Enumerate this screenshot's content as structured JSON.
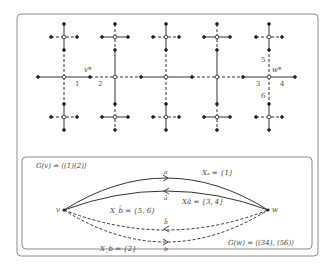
{
  "top_panel": {
    "vertex_labels": {
      "v_star": "v*",
      "w_star": "w*"
    },
    "edge_labels": [
      "1",
      "2",
      "3",
      "4",
      "5",
      "6"
    ]
  },
  "bottom_panel": {
    "G_v": "G(v) = ⟨(1)(2)⟩",
    "G_w": "G(w) = ⟨(34), (56)⟩",
    "vertex_v": "v",
    "vertex_w": "w",
    "edges": [
      {
        "id": "a",
        "label": "a",
        "set_label": "Xₐ = {1}",
        "style": "solid"
      },
      {
        "id": "abar",
        "label": "ā",
        "set_label": "Xā = {3, 4}",
        "style": "solid"
      },
      {
        "id": "bbar",
        "label": "b̄",
        "set_label": "X_b̄ = {5, 6}",
        "style": "dashed"
      },
      {
        "id": "b",
        "label": "b",
        "set_label": "X_b = {2}",
        "style": "dashed"
      }
    ]
  },
  "colors": {
    "line": "#333333",
    "frame": "#8a8a8a",
    "text": "#444444"
  }
}
